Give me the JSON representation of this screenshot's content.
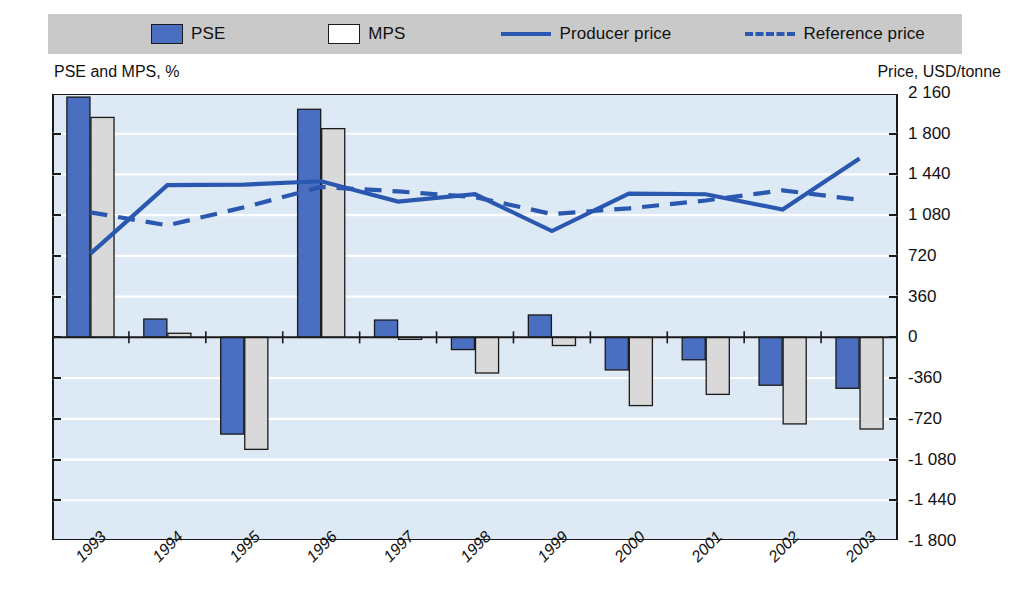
{
  "legend": {
    "items": [
      {
        "label": "PSE",
        "marker": "blue-square-swatch",
        "color": "#4a6fc0"
      },
      {
        "label": "MPS",
        "marker": "white-square-swatch",
        "color": "#d9d9d9"
      },
      {
        "label": "Producer price",
        "marker": "solid-line-swatch",
        "color": "#2a58b0"
      },
      {
        "label": "Reference price",
        "marker": "dashed-line-swatch",
        "color": "#2a58b0"
      }
    ]
  },
  "axis_captions": {
    "left": "PSE and MPS, %",
    "right": "Price, USD/tonne"
  },
  "colors": {
    "pse_bar": "#4a6fc0",
    "mps_bar": "#d9d9d9",
    "line": "#2a58b0",
    "plot_background": "#dde9f5",
    "gridline": "#ffffff",
    "legend_background": "#c9c9c9",
    "axis": "#1a1a1a"
  },
  "chart_data": {
    "type": "bar",
    "title": "",
    "xlabel": "",
    "ylabel": "PSE and MPS, %",
    "y2label": "Price, USD/tonne",
    "grid": true,
    "legend_position": "top",
    "categories": [
      "1993",
      "1994",
      "1995",
      "1996",
      "1997",
      "1998",
      "1999",
      "2000",
      "2001",
      "2002",
      "2003"
    ],
    "ylim": [
      -10,
      12
    ],
    "yticks": [
      12,
      10,
      8,
      6,
      4,
      2,
      0,
      -2,
      -4,
      -6,
      -8,
      -10
    ],
    "ytick_labels": [
      "12",
      "10",
      "8",
      "6",
      "4",
      "2",
      "0",
      "-2",
      "-4",
      "-6",
      "-8",
      "-10"
    ],
    "y2lim": [
      -1800,
      2160
    ],
    "y2ticks": [
      2160,
      1800,
      1440,
      1080,
      720,
      360,
      0,
      -360,
      -720,
      -1080,
      -1440,
      -1800
    ],
    "y2tick_labels": [
      "2 160",
      "1 800",
      "1 440",
      "1 080",
      "720",
      "360",
      "0",
      "-360",
      "-720",
      "-1 080",
      "-1 440",
      "-1 800"
    ],
    "series": [
      {
        "name": "PSE",
        "kind": "bar",
        "axis": "left",
        "unit": "%",
        "values": [
          11.8,
          0.9,
          -4.75,
          11.2,
          0.85,
          -0.6,
          1.1,
          -1.6,
          -1.1,
          -2.35,
          -2.5
        ]
      },
      {
        "name": "MPS",
        "kind": "bar",
        "axis": "left",
        "unit": "%",
        "values": [
          10.8,
          0.2,
          -5.5,
          10.25,
          -0.1,
          -1.75,
          -0.4,
          -3.35,
          -2.8,
          -4.25,
          -4.5
        ]
      },
      {
        "name": "Producer price",
        "kind": "line",
        "style": "solid",
        "axis": "right",
        "unit": "USD/tonne",
        "values": [
          740,
          1345,
          1350,
          1380,
          1200,
          1265,
          940,
          1270,
          1265,
          1130,
          1580
        ]
      },
      {
        "name": "Reference price",
        "kind": "line",
        "style": "dashed",
        "axis": "right",
        "unit": "USD/tonne",
        "values": [
          1105,
          990,
          1150,
          1330,
          1290,
          1240,
          1090,
          1140,
          1210,
          1300,
          1215
        ]
      }
    ]
  }
}
